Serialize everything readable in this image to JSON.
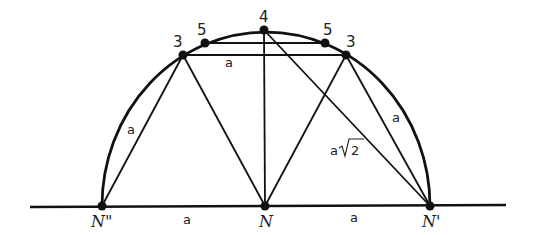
{
  "diagram": {
    "title": "",
    "points": {
      "N_double_prime": {
        "label": "N\"",
        "x": 102,
        "y": 206
      },
      "N": {
        "label": "N",
        "x": 265,
        "y": 206
      },
      "N_prime": {
        "label": "N'",
        "x": 430,
        "y": 206
      },
      "p3_left": {
        "label": "3",
        "x": 183,
        "y": 55
      },
      "p3_right": {
        "label": "3",
        "x": 346,
        "y": 55
      },
      "p5_left": {
        "label": "5",
        "x": 205,
        "y": 43
      },
      "p5_right": {
        "label": "5",
        "x": 325,
        "y": 43
      },
      "p4": {
        "label": "4",
        "x": 264,
        "y": 30
      }
    },
    "segment_labels": {
      "top_chord": "a",
      "left_chord": "a",
      "right_chord": "a",
      "diagonal": "a√2",
      "diagonal_prefix": "a",
      "diagonal_radicand": "2",
      "base_left": "a",
      "base_right": "a"
    },
    "line_color": "#111111",
    "text_color": "#222222"
  }
}
